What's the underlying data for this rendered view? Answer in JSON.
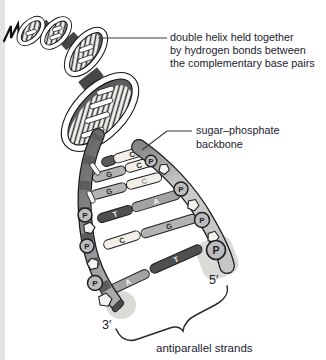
{
  "diagram": {
    "title_label": {
      "line1": "double helix held together",
      "line2": "by hydrogen bonds between",
      "line3": "the complementary base pairs"
    },
    "backbone_label": {
      "line1": "sugar–phosphate",
      "line2": "backbone"
    },
    "strands_label": "antiparallel strands",
    "three_prime": "3′",
    "five_prime": "5′",
    "phosphate": "P",
    "base_pairs": [
      {
        "left": "",
        "right": "C"
      },
      {
        "left": "G",
        "right": "C"
      },
      {
        "left": "G",
        "right": "C"
      },
      {
        "left": "T",
        "right": "A"
      },
      {
        "left": "C",
        "right": "G"
      },
      {
        "left": "A",
        "right": "T"
      }
    ],
    "colors": {
      "background": "#ffffff",
      "text": "#1b1b2f",
      "base_c": "#f1efe7",
      "base_g": "#b3b3b3",
      "base_a": "#a3a3a3",
      "base_t": "#4f4f4f",
      "backbone_left_dark": "#646464",
      "backbone_left_light": "#ababab",
      "backbone_right_dark": "#878787",
      "backbone_right_light": "#cdcdcd",
      "phosphate_fill": "#bdbdbd",
      "outline": "#1c1c1c"
    }
  }
}
